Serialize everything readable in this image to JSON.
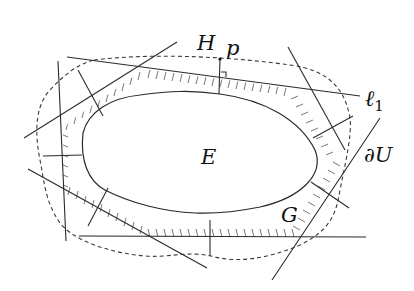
{
  "diagram": {
    "labels": {
      "H": "H",
      "p": "p",
      "l1": "ℓ",
      "l1_sub": "1",
      "E": "E",
      "dU": "∂U",
      "G": "G"
    },
    "colors": {
      "stroke": "#2a2a2a",
      "background": "#ffffff"
    }
  }
}
